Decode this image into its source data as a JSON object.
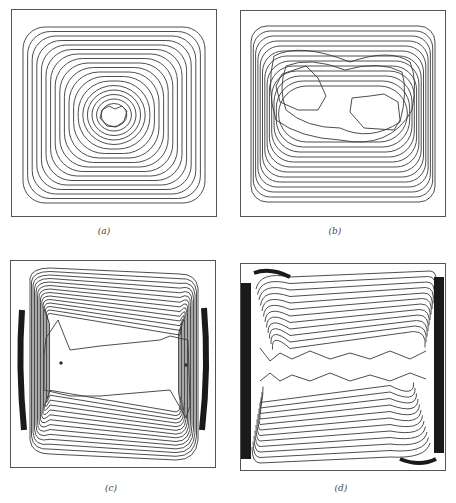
{
  "figure": {
    "panels": [
      {
        "id": "a",
        "label": "(a)",
        "pattern": "single-central-vortex"
      },
      {
        "id": "b",
        "label": "(b)",
        "pattern": "two-inner-cells"
      },
      {
        "id": "c",
        "label": "(c)",
        "pattern": "elongated-core-boundary-layers"
      },
      {
        "id": "d",
        "label": "(d)",
        "pattern": "thin-boundary-layers-stratified-core"
      }
    ]
  },
  "style": {
    "line_color": "#3a3a3a",
    "frame_color": "#555555",
    "dense_color": "#1a1a1a"
  }
}
